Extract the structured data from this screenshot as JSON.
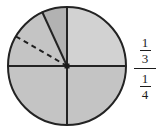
{
  "figure": {
    "name": "circle-fraction-diagram",
    "background": "#ffffff"
  },
  "circle": {
    "center_x": 67,
    "center_y": 66,
    "radius": 59,
    "outline_color": "#232323",
    "outline_width": 2,
    "fill_color": "#c4c4c4",
    "light_fill_color": "#d2d2d2",
    "dark_wedge_fill_color": "#b2b2b2",
    "center_dot_color": "#1a1a1a"
  },
  "diameters": {
    "horizontal_label": "horizontal-diameter",
    "vertical_label": "vertical-diameter",
    "color": "#232323",
    "width": 2
  },
  "solid_radius": {
    "label": "solid-radius-line",
    "angle_degrees": 115,
    "color": "#232323",
    "width": 2
  },
  "dashed_radius": {
    "label": "dashed-radius-line",
    "angle_degrees": 150,
    "color": "#1f1f1f",
    "width": 2,
    "dash_pattern": "5 4"
  },
  "fraction_label": {
    "upper": {
      "numerator": "1",
      "denominator": "3"
    },
    "lower": {
      "numerator": "1",
      "denominator": "4"
    }
  }
}
